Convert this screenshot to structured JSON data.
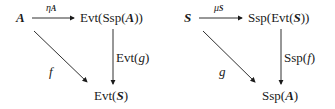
{
  "diagrams": [
    {
      "name": "left-triangle",
      "source": "A",
      "top_right": "Evt(Ssp(A))",
      "bottom": "Evt(S)",
      "top_arrow_label": "η_A",
      "right_arrow_label": "Evt(g)",
      "diagonal_label": "f"
    },
    {
      "name": "right-triangle",
      "source": "S",
      "top_right": "Ssp(Evt(S))",
      "bottom": "Ssp(A)",
      "top_arrow_label": "μ_S",
      "right_arrow_label": "Ssp(f)",
      "diagonal_label": "g"
    }
  ],
  "text": {
    "A": "A",
    "S": "S",
    "eta": "η",
    "mu": "μ",
    "evt": "Evt(",
    "ssp": "Ssp(",
    "close1": ")",
    "close2": "))",
    "g": "g",
    "f": "f"
  }
}
